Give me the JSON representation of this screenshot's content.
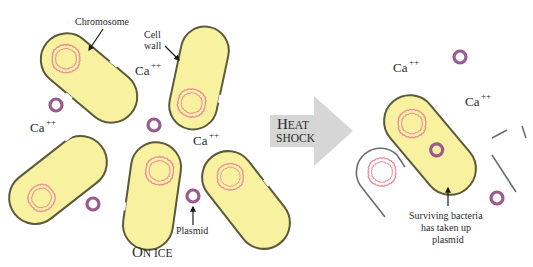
{
  "diagram": {
    "colors": {
      "cell_fill": "#f7f1a0",
      "cell_wall": "#5b5a3a",
      "chromosome": "#e8919a",
      "plasmid": "#9a5a8e",
      "arrow_fill": "#d6d6d6",
      "text": "#2a2a2a",
      "ghost_wall": "#6e6e6e"
    },
    "labels": {
      "chromosome": "Chromosome",
      "cell_wall_line1": "Cell",
      "cell_wall_line2": "wall",
      "plasmid": "Plasmid",
      "on_ice_initial": "O",
      "on_ice_rest": "N ICE",
      "heat_initial": "H",
      "heat_rest": "EAT",
      "shock": "SHOCK",
      "surviving_line1": "Surviving bacteria",
      "surviving_line2": "has taken up",
      "surviving_line3": "plasmid",
      "ca": "Ca",
      "ca_charge": "++"
    },
    "left_panel": {
      "caption": "On ice",
      "cells": 5,
      "free_plasmids": 4,
      "calcium_labels": 3
    },
    "right_panel": {
      "caption": "After heat shock",
      "surviving_cells": 1,
      "lysed_cells": 2,
      "free_plasmids": 2,
      "calcium_labels": 2
    }
  }
}
